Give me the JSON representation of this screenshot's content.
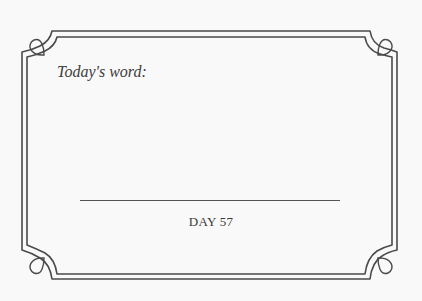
{
  "card": {
    "prompt": "Today's word:",
    "answer_line": "",
    "day_label": "DAY 57"
  },
  "colors": {
    "background": "#f9f9f9",
    "border": "#4a4a4a",
    "text": "#3c3c3c"
  }
}
